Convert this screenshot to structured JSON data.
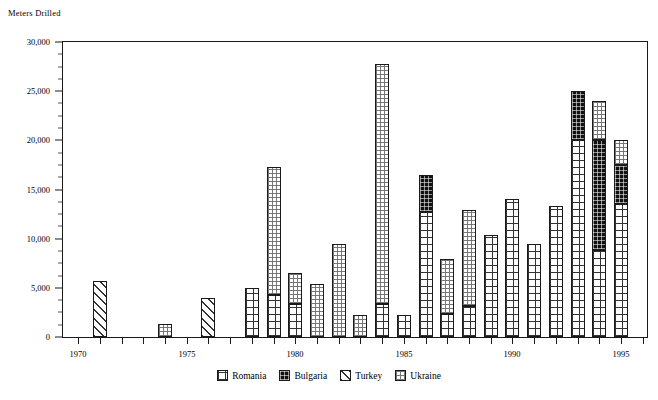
{
  "chart_data": {
    "type": "bar",
    "stacked": true,
    "title": "",
    "ylabel": "Meters Drilled",
    "xlabel": "",
    "ylim": [
      0,
      30000
    ],
    "ytick_labels": [
      "0",
      "5,000",
      "10,000",
      "15,000",
      "20,000",
      "25,000",
      "30,000"
    ],
    "ytick_values": [
      0,
      5000,
      10000,
      15000,
      20000,
      25000,
      30000
    ],
    "yminor_step": 1250,
    "grid": false,
    "legend_position": "bottom",
    "xlim": [
      1969.3,
      1996.2
    ],
    "xtick_labels": [
      "1970",
      "1975",
      "1980",
      "1985",
      "1990",
      "1995"
    ],
    "xtick_values": [
      1970,
      1975,
      1980,
      1985,
      1990,
      1995
    ],
    "x": [
      1970,
      1971,
      1972,
      1973,
      1974,
      1975,
      1976,
      1977,
      1978,
      1979,
      1980,
      1981,
      1982,
      1983,
      1984,
      1985,
      1986,
      1987,
      1988,
      1989,
      1990,
      1991,
      1992,
      1993,
      1994,
      1995
    ],
    "categories": [
      1970,
      1971,
      1972,
      1973,
      1974,
      1975,
      1976,
      1977,
      1978,
      1979,
      1980,
      1981,
      1982,
      1983,
      1984,
      1985,
      1986,
      1987,
      1988,
      1989,
      1990,
      1991,
      1992,
      1993,
      1994,
      1995
    ],
    "series": [
      {
        "name": "Romania",
        "pattern": "grid-square",
        "color": "#ffffff",
        "values": [
          0,
          0,
          0,
          0,
          0,
          0,
          0,
          0,
          5000,
          4250,
          3400,
          0,
          0,
          0,
          3400,
          2250,
          12700,
          2300,
          3200,
          10400,
          14000,
          9500,
          13300,
          20000,
          8800,
          13500
        ]
      },
      {
        "name": "Bulgaria",
        "pattern": "solid-black",
        "color": "#111111",
        "values": [
          0,
          0,
          0,
          0,
          0,
          0,
          0,
          0,
          0,
          0,
          0,
          0,
          0,
          0,
          0,
          0,
          3800,
          0,
          0,
          0,
          0,
          0,
          0,
          5000,
          11200,
          4000
        ]
      },
      {
        "name": "Turkey",
        "pattern": "diagonal-hatch",
        "color": "#ffffff",
        "values": [
          0,
          5700,
          0,
          0,
          0,
          0,
          4000,
          0,
          0,
          0,
          0,
          0,
          0,
          0,
          0,
          0,
          0,
          0,
          0,
          0,
          0,
          0,
          0,
          0,
          0,
          0
        ]
      },
      {
        "name": "Ukraine",
        "pattern": "fine-dot-grid",
        "color": "#ffffff",
        "values": [
          0,
          0,
          0,
          0,
          1300,
          0,
          0,
          0,
          0,
          13000,
          3150,
          5400,
          9500,
          2250,
          24400,
          0,
          0,
          5600,
          9700,
          0,
          0,
          0,
          0,
          0,
          4000,
          2500
        ]
      }
    ],
    "totals": [
      0,
      5700,
      0,
      0,
      1300,
      0,
      4000,
      0,
      5000,
      17250,
      6550,
      5400,
      9500,
      2250,
      27800,
      2250,
      16500,
      7900,
      12900,
      10400,
      14000,
      9500,
      13300,
      25000,
      24000,
      20000
    ]
  },
  "legend": {
    "items": [
      {
        "label": "Romania",
        "key": "romania"
      },
      {
        "label": "Bulgaria",
        "key": "bulgaria"
      },
      {
        "label": "Turkey",
        "key": "turkey"
      },
      {
        "label": "Ukraine",
        "key": "ukraine"
      }
    ]
  }
}
